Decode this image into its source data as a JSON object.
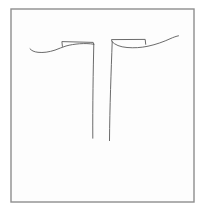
{
  "canvas": {
    "width": 208,
    "height": 210,
    "background_color": "#ffffff",
    "frame": {
      "x": 11,
      "y": 9,
      "width": 183,
      "height": 193,
      "border_color": "#8e8e8e",
      "fill_color": "#fdfdfd"
    },
    "sketch": {
      "description": "freehand line sketch: two mirrored pole shapes with flat looped flag tops and long outward sweeping curves",
      "stroke_color": "#5a5a5a",
      "stroke_width": 0.9,
      "strokes": [
        {
          "name": "left-sweep-curve",
          "d": "M 30,48.8 C 31.5,50.6 34,51.9 38,52.3 C 43,52.9 49,52.1 55,50.1 C 59,48.7 62,47.2 66,46 C 74,43.8 85,42.8 93.6,44.2"
        },
        {
          "name": "left-top-flag",
          "d": "M 62.4,46.4 L 61.9,41.6 L 93.2,42.4 L 93.8,44.2"
        },
        {
          "name": "left-pole",
          "d": "M 93.8,44.2 C 93.2,70 92.6,105 92.8,138.2"
        },
        {
          "name": "right-pole",
          "d": "M 112.2,41.8 C 111.2,70 109.7,108 109.5,140.6"
        },
        {
          "name": "right-sweep-curve",
          "d": "M 112.2,41.8 C 115,44.9 120,46.9 127,47.5 C 134,48.1 141,47.7 148,46.2 C 156,44.5 164,41.6 170,38.8 C 173.5,37.2 176.5,36.2 178.5,35.8"
        },
        {
          "name": "right-top-flag",
          "d": "M 111.9,41.4 L 111.5,39.6 L 145.2,39.4 L 145.7,44.3"
        }
      ]
    }
  }
}
